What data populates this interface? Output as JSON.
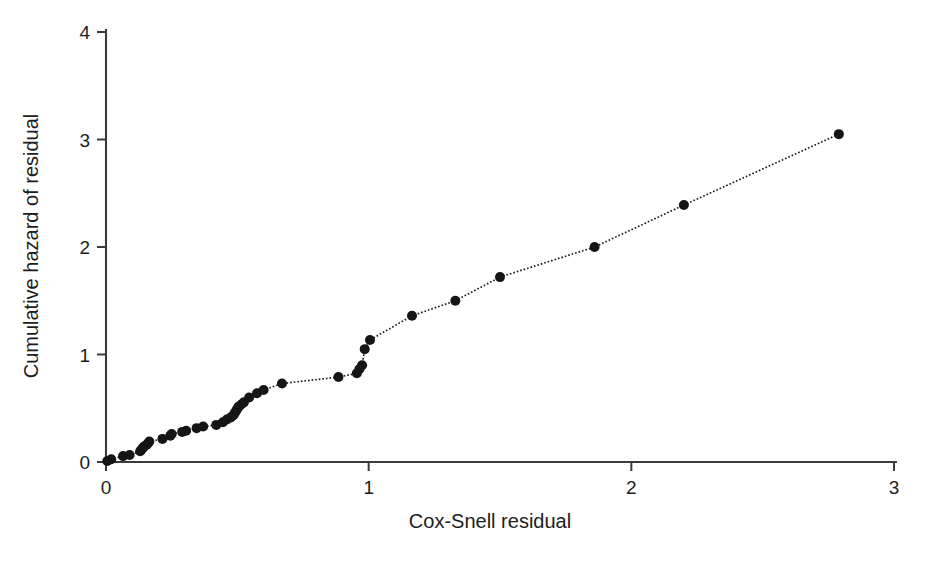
{
  "chart_data": {
    "type": "scatter",
    "title": "",
    "subtitle": "",
    "xlabel": "Cox-Snell residual",
    "ylabel": "Cumulative hazard of residual",
    "xlim": [
      0,
      3
    ],
    "ylim": [
      0,
      4
    ],
    "xticks": [
      0,
      1,
      2,
      3
    ],
    "yticks": [
      0,
      1,
      2,
      3,
      4
    ],
    "xticklabels": [
      "0",
      "1",
      "2",
      "3"
    ],
    "yticklabels": [
      "0",
      "1",
      "2",
      "3",
      "4"
    ],
    "grid": false,
    "legend": null,
    "marker_style": "filled-circle",
    "marker_color": "#151515",
    "line_style": "dotted",
    "line_color": "#1a1a1a",
    "series": [
      {
        "name": "Cumulative hazard vs Cox-Snell residual",
        "x": [
          0.005,
          0.02,
          0.065,
          0.09,
          0.13,
          0.135,
          0.14,
          0.145,
          0.155,
          0.16,
          0.165,
          0.215,
          0.245,
          0.25,
          0.29,
          0.305,
          0.345,
          0.37,
          0.42,
          0.445,
          0.46,
          0.475,
          0.485,
          0.49,
          0.495,
          0.5,
          0.505,
          0.515,
          0.525,
          0.545,
          0.575,
          0.6,
          0.67,
          0.885,
          0.955,
          0.965,
          0.975,
          0.985,
          1.005,
          1.165,
          1.33,
          1.5,
          1.86,
          2.2,
          2.79
        ],
        "y": [
          0.01,
          0.025,
          0.055,
          0.065,
          0.1,
          0.115,
          0.13,
          0.145,
          0.16,
          0.175,
          0.19,
          0.215,
          0.245,
          0.26,
          0.28,
          0.29,
          0.315,
          0.33,
          0.345,
          0.37,
          0.395,
          0.415,
          0.435,
          0.455,
          0.475,
          0.495,
          0.515,
          0.535,
          0.555,
          0.6,
          0.64,
          0.67,
          0.73,
          0.79,
          0.825,
          0.865,
          0.9,
          1.05,
          1.135,
          1.36,
          1.5,
          1.72,
          2.0,
          2.39,
          3.05
        ]
      }
    ]
  }
}
